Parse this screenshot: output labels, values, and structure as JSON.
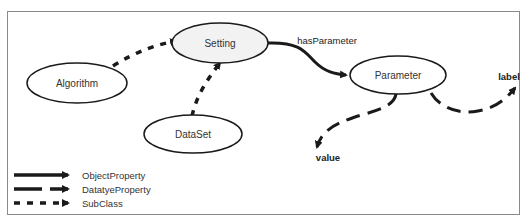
{
  "diagram": {
    "nodes": [
      {
        "id": "algorithm",
        "label": "Algorithm",
        "fill": "#ffffff"
      },
      {
        "id": "setting",
        "label": "Setting",
        "fill": "#f2f2f2"
      },
      {
        "id": "dataset",
        "label": "DataSet",
        "fill": "#ffffff"
      },
      {
        "id": "parameter",
        "label": "Parameter",
        "fill": "#ffffff"
      }
    ],
    "edges": [
      {
        "from": "algorithm",
        "to": "setting",
        "type": "SubClass",
        "label": ""
      },
      {
        "from": "dataset",
        "to": "setting",
        "type": "SubClass",
        "label": ""
      },
      {
        "from": "setting",
        "to": "parameter",
        "type": "ObjectProperty",
        "label": "hasParameter"
      },
      {
        "from": "parameter",
        "to": "value",
        "type": "DatatyeProperty",
        "label": "value"
      },
      {
        "from": "parameter",
        "to": "label",
        "type": "DatatyeProperty",
        "label": "label"
      }
    ]
  },
  "legend": {
    "items": [
      {
        "label": "ObjectProperty",
        "style": "solid"
      },
      {
        "label": "DatatyeProperty",
        "style": "long-dash"
      },
      {
        "label": "SubClass",
        "style": "short-dash"
      }
    ]
  },
  "colors": {
    "stroke": "#1a1a1a",
    "frame": "#8a8a8a"
  }
}
